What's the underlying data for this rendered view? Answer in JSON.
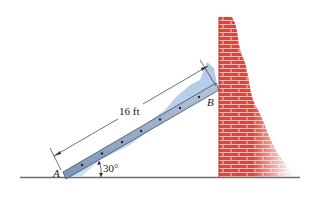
{
  "figure": {
    "type": "statics-ladder-against-wall",
    "ladder": {
      "length_label": "16 ft",
      "angle_label": "30°",
      "end_bottom_label": "A",
      "end_top_label": "B",
      "color": "#8ea6c4",
      "rung_dots": 7
    },
    "wall": {
      "material": "brick",
      "color": "#d9534a",
      "mortar_color": "#f3c0b8"
    },
    "ground": {
      "color": "#777777"
    },
    "shadow_color": "#9fbfe6"
  }
}
